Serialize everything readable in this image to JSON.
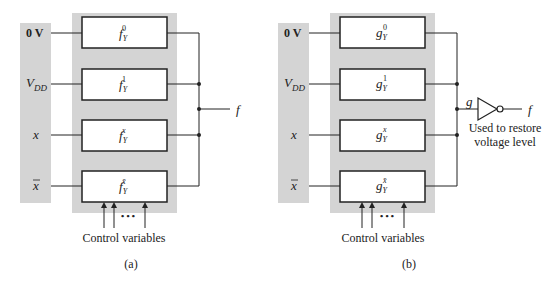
{
  "colors": {
    "panel": "#d4d4d4",
    "line": "#222222",
    "box_fill": "#ffffff"
  },
  "diagram_a": {
    "caption": "(a)",
    "inputs": [
      "0 V",
      "V",
      "x",
      "x"
    ],
    "vdd_subscript": "DD",
    "functions": [
      {
        "base": "f",
        "sub": "Y",
        "sup": "0"
      },
      {
        "base": "f",
        "sub": "Y",
        "sup": "1"
      },
      {
        "base": "f",
        "sub": "Y",
        "sup": "x"
      },
      {
        "base": "f",
        "sub": "Y",
        "sup": "x̄"
      }
    ],
    "output_label": "f",
    "control_label": "Control variables",
    "ellipsis": "• • •"
  },
  "diagram_b": {
    "caption": "(b)",
    "inputs": [
      "0 V",
      "V",
      "x",
      "x"
    ],
    "vdd_subscript": "DD",
    "functions": [
      {
        "base": "g",
        "sub": "Y",
        "sup": "0"
      },
      {
        "base": "g",
        "sub": "Y",
        "sup": "1"
      },
      {
        "base": "g",
        "sub": "Y",
        "sup": "x"
      },
      {
        "base": "g",
        "sub": "Y",
        "sup": "x̄"
      }
    ],
    "inverter_input_label": "g",
    "output_label": "f",
    "note_line1": "Used to restore",
    "note_line2": "voltage level",
    "control_label": "Control variables",
    "ellipsis": "• • •"
  }
}
